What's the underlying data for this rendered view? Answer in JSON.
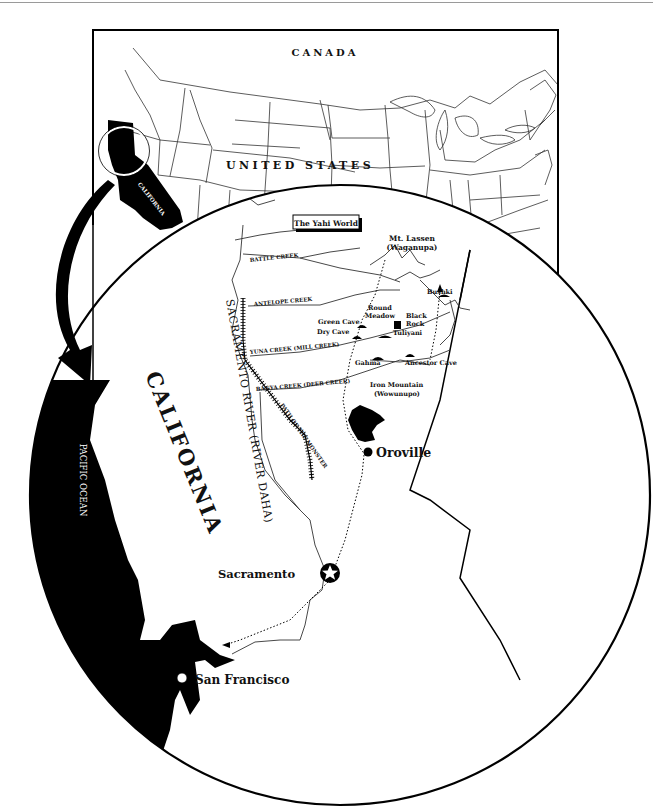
{
  "inset_map": {
    "country_north": "CANADA",
    "country_main": "UNITED STATES",
    "state_label": "CALIFORNIA"
  },
  "main_map": {
    "title": "The Yahi World",
    "state_label": "CALIFORNIA",
    "ocean_label": "PACIFIC OCEAN",
    "river_label": "SACRAMENTO RIVER (RIVER DAHA)",
    "path_label": "PATH OF THE MONSTER",
    "creeks": {
      "battle": "BATTLE CREEK",
      "antelope": "ANTELOPE CREEK",
      "yuna": "YUNA CREEK (MILL CREEK)",
      "banya": "BANYA CREEK (DEER CREEK)"
    },
    "places": {
      "mt_lassen_1": "Mt. Lassen",
      "mt_lassen_2": "(Waganupa)",
      "bushki": "Bushki",
      "round_meadow_1": "Round",
      "round_meadow_2": "Meadow",
      "black_rock_1": "Black",
      "black_rock_2": "Rock",
      "green_cave": "Green Cave",
      "dry_cave": "Dry Cave",
      "tuliyani": "Tuliyani",
      "gahma": "Gahma",
      "ancestor_cave": "Ancestor Cave",
      "iron_mountain_1": "Iron Mountain",
      "iron_mountain_2": "(Wowunupo)"
    },
    "cities": {
      "oroville": "Oroville",
      "sacramento": "Sacramento",
      "san_francisco": "San Francisco"
    }
  }
}
